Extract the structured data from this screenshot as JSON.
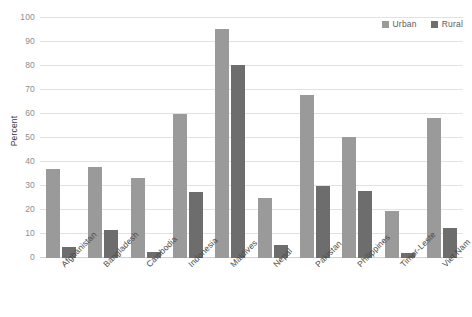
{
  "chart_data": {
    "type": "bar",
    "title": "",
    "subtitle": "",
    "xlabel": "",
    "ylabel": "Percent",
    "ylim": [
      0,
      100
    ],
    "ytick_step": 10,
    "yticks": [
      0,
      10,
      20,
      30,
      40,
      50,
      60,
      70,
      80,
      90,
      100
    ],
    "ytick_labels": [
      "0",
      "10",
      "20",
      "30",
      "40",
      "50",
      "60",
      "70",
      "80",
      "90",
      "100"
    ],
    "grid": true,
    "grid_axis": "y",
    "legend_position": "top-right",
    "categories": [
      "Afghanistan",
      "Bangladesh",
      "Cambodia",
      "Indonesia",
      "Maldives",
      "Nepal",
      "Pakistan",
      "Philippines",
      "Timor-Leste",
      "Viet Nam"
    ],
    "series": [
      {
        "name": "Urban",
        "color": "#9a9a9a",
        "values": [
          37,
          38,
          33.5,
          60,
          95.5,
          25,
          68,
          50.5,
          19.5,
          58.5
        ]
      },
      {
        "name": "Rural",
        "color": "#6d6d6d",
        "values": [
          4.5,
          11.5,
          2.5,
          27.5,
          80.5,
          5.5,
          30,
          28,
          2,
          12.5
        ]
      }
    ],
    "annotations": []
  },
  "legend": {
    "items": [
      {
        "label": "Urban",
        "color": "#9a9a9a"
      },
      {
        "label": "Rural",
        "color": "#6d6d6d"
      }
    ]
  },
  "colors": {
    "urban": "#9a9a9a",
    "rural": "#6d6d6d",
    "gridline": "#e2e2e2",
    "baseline": "#d2d2d2",
    "tick_text": "#8d8d8d",
    "label_text": "#4a4a4a",
    "background": "#ffffff"
  }
}
